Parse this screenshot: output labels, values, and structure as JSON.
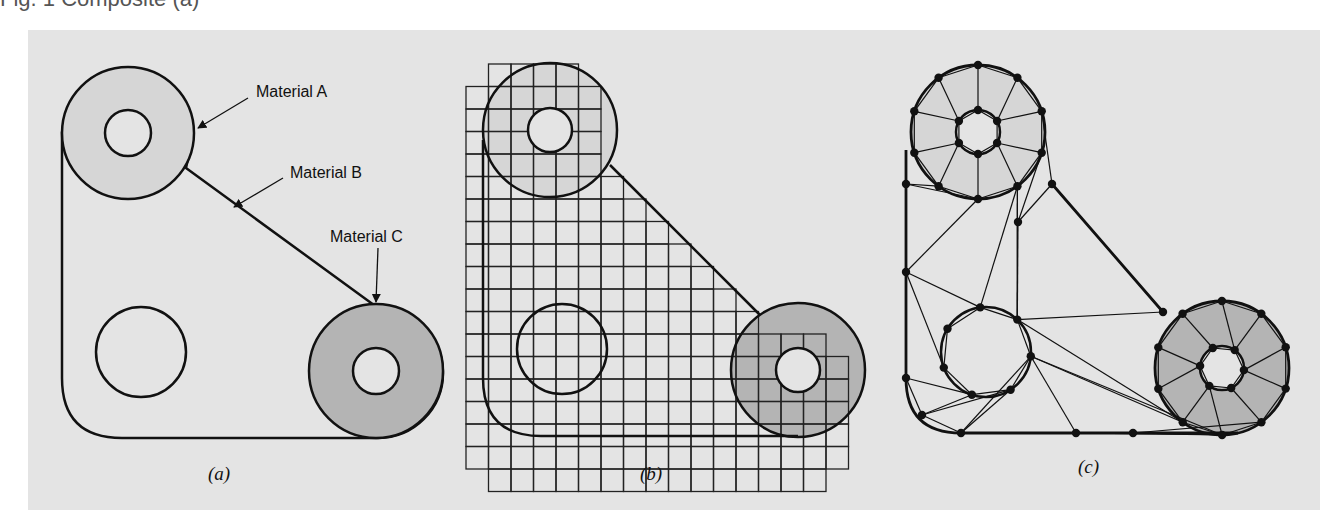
{
  "figure": {
    "top_cropped_text": "Fig. 1 Composite (a)",
    "colors": {
      "background": "#e4e4e4",
      "material_a_fill": "#d6d6d6",
      "material_c_fill": "#b4b4b4",
      "stroke": "#111111",
      "node": "#111111"
    },
    "panels": [
      {
        "id": "a",
        "caption": "(a)",
        "description": "Domain with three materials",
        "labels": [
          {
            "text": "Material A"
          },
          {
            "text": "Material B"
          },
          {
            "text": "Material C"
          }
        ]
      },
      {
        "id": "b",
        "caption": "(b)",
        "description": "Structured square grid approximation"
      },
      {
        "id": "c",
        "caption": "(c)",
        "description": "Unstructured triangular mesh with nodes"
      }
    ]
  }
}
